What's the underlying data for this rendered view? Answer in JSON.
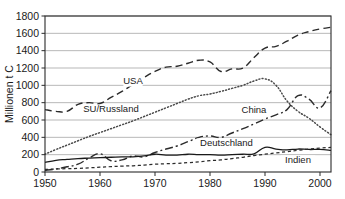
{
  "chart_data": {
    "type": "line",
    "title": "",
    "subtitle": "",
    "xlabel": "",
    "ylabel": "Millionen t C",
    "xlim": [
      1950,
      2002
    ],
    "ylim": [
      0,
      1800
    ],
    "grid": true,
    "legend_position": "inline-labels",
    "xticks": [
      "1950",
      "1960",
      "1970",
      "1980",
      "1990",
      "2000"
    ],
    "xtick_values": [
      1950,
      1960,
      1970,
      1980,
      1990,
      2000
    ],
    "yticks": [
      "0",
      "200",
      "400",
      "600",
      "800",
      "1000",
      "1200",
      "1400",
      "1600",
      "1800"
    ],
    "ytick_values": [
      0,
      200,
      400,
      600,
      800,
      1000,
      1200,
      1400,
      1600,
      1800
    ],
    "x": [
      1950,
      1952,
      1954,
      1956,
      1958,
      1960,
      1962,
      1964,
      1966,
      1968,
      1970,
      1972,
      1974,
      1976,
      1978,
      1980,
      1982,
      1984,
      1986,
      1988,
      1990,
      1992,
      1994,
      1996,
      1998,
      2000,
      2002
    ],
    "series": [
      {
        "name": "USA",
        "label": "USA",
        "style": "dashed",
        "color": "#2b2b2b",
        "values": [
          720,
          700,
          700,
          780,
          800,
          790,
          860,
          930,
          1010,
          1090,
          1160,
          1210,
          1220,
          1255,
          1290,
          1270,
          1160,
          1190,
          1200,
          1320,
          1430,
          1450,
          1510,
          1580,
          1620,
          1650,
          1670
        ]
      },
      {
        "name": "SU/Russland",
        "label": "SU/Russland",
        "style": "dotted",
        "color": "#4a4a4a",
        "values": [
          205,
          260,
          310,
          360,
          410,
          455,
          500,
          545,
          590,
          640,
          690,
          740,
          790,
          840,
          880,
          900,
          930,
          965,
          1000,
          1050,
          1075,
          1000,
          820,
          700,
          620,
          520,
          430
        ]
      },
      {
        "name": "China",
        "label": "China",
        "style": "dash-dot",
        "color": "#2b2b2b",
        "values": [
          20,
          35,
          60,
          90,
          160,
          210,
          130,
          140,
          185,
          175,
          225,
          265,
          300,
          350,
          400,
          415,
          400,
          450,
          500,
          555,
          610,
          660,
          720,
          880,
          840,
          740,
          940
        ]
      },
      {
        "name": "Deutschland",
        "label": "Deutschland",
        "style": "solid",
        "color": "#1a1a1a",
        "values": [
          110,
          135,
          145,
          155,
          160,
          165,
          170,
          175,
          175,
          185,
          205,
          195,
          195,
          205,
          200,
          200,
          195,
          200,
          205,
          210,
          285,
          265,
          255,
          265,
          260,
          260,
          250
        ]
      },
      {
        "name": "Indien",
        "label": "Indien",
        "style": "short-dashed",
        "color": "#2b2b2b",
        "values": [
          30,
          35,
          38,
          42,
          48,
          55,
          62,
          68,
          72,
          80,
          90,
          95,
          100,
          108,
          118,
          130,
          140,
          155,
          170,
          190,
          205,
          220,
          235,
          250,
          265,
          275,
          285
        ]
      }
    ],
    "annotations": [
      {
        "text": "USA",
        "x": 1966,
        "y": 1020
      },
      {
        "text": "SU/Russland",
        "x": 1962,
        "y": 690
      },
      {
        "text": "China",
        "x": 1988,
        "y": 680
      },
      {
        "text": "Deutschland",
        "x": 1983,
        "y": 300
      },
      {
        "text": "Indien",
        "x": 1996,
        "y": 105
      }
    ]
  }
}
